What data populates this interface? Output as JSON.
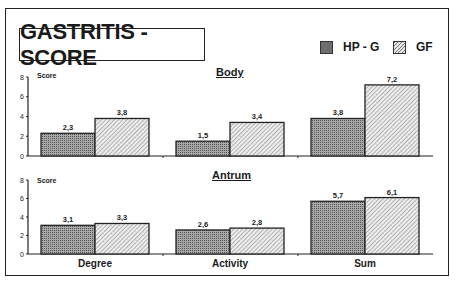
{
  "title": "GASTRITIS - SCORE",
  "legend": [
    {
      "label": "HP - G",
      "pattern": "dotted-gray"
    },
    {
      "label": "GF",
      "pattern": "diagonal-hatch"
    }
  ],
  "panels": {
    "body": {
      "title": "Body",
      "ylabel": "Score"
    },
    "antrum": {
      "title": "Antrum",
      "ylabel": "Score"
    }
  },
  "categories": [
    "Degree",
    "Activity",
    "Sum"
  ],
  "chart_data": [
    {
      "type": "bar",
      "title": "Body",
      "ylabel": "Score",
      "xlabel": "",
      "ylim": [
        0,
        8
      ],
      "yticks": [
        0,
        2,
        4,
        6,
        8
      ],
      "categories": [
        "Degree",
        "Activity",
        "Sum"
      ],
      "series": [
        {
          "name": "HP - G",
          "values": [
            2.3,
            1.5,
            3.8
          ],
          "labels": [
            "2,3",
            "1,5",
            "3,8"
          ]
        },
        {
          "name": "GF",
          "values": [
            3.8,
            3.4,
            7.2
          ],
          "labels": [
            "3,8",
            "3,4",
            "7,2"
          ]
        }
      ],
      "grid": false,
      "legend_position": "top-right"
    },
    {
      "type": "bar",
      "title": "Antrum",
      "ylabel": "Score",
      "xlabel": "",
      "ylim": [
        0,
        8
      ],
      "yticks": [
        0,
        2,
        4,
        6,
        8
      ],
      "categories": [
        "Degree",
        "Activity",
        "Sum"
      ],
      "series": [
        {
          "name": "HP - G",
          "values": [
            3.1,
            2.6,
            5.7
          ],
          "labels": [
            "3,1",
            "2,6",
            "5,7"
          ]
        },
        {
          "name": "GF",
          "values": [
            3.3,
            2.8,
            6.1
          ],
          "labels": [
            "3,3",
            "2,8",
            "6,1"
          ]
        }
      ],
      "grid": false,
      "legend_position": "top-right"
    }
  ]
}
